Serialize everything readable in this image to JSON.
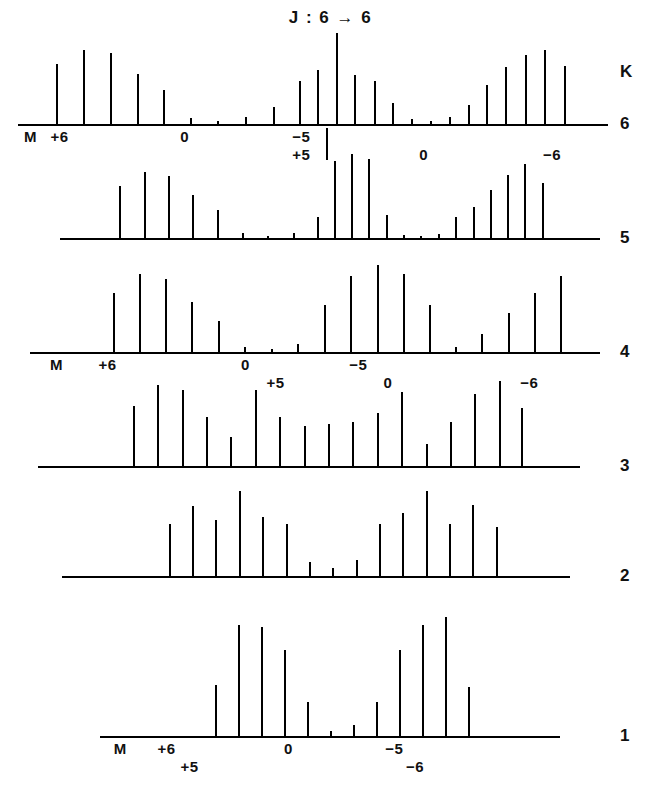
{
  "figure": {
    "title": "J : 6 → 6",
    "k_axis_header": "K",
    "background_color": "#ffffff",
    "ink_color": "#000000"
  },
  "chart_data": {
    "type": "bar",
    "title": "J : 6 → 6",
    "subtitle": "",
    "xlabel": "M",
    "ylabel": "K",
    "grid": false,
    "legend": null,
    "xlim": [
      0,
      100
    ],
    "ylim": [
      0,
      100
    ],
    "x_tick_labels_row_top": [
      "M",
      "+6",
      "0",
      "-5",
      "+5",
      "0",
      "-6"
    ],
    "x_tick_labels_row_middle": [
      "M",
      "+6",
      "0",
      "+5",
      "-5",
      "0",
      "-6"
    ],
    "x_tick_labels_row_bottom": [
      "M",
      "+6",
      "+5",
      "0",
      "-5",
      "-6"
    ],
    "series": [
      {
        "name": "K = 6",
        "k": 6,
        "x": [
          6.4,
          11.1,
          15.6,
          20.1,
          24.6,
          29.2,
          33.8,
          38.5,
          43.2,
          47.6,
          50.7,
          53.9,
          57.0,
          60.3,
          63.4,
          66.6,
          69.8,
          73.0,
          76.2,
          79.4,
          82.6,
          85.9,
          89.2,
          92.5
        ],
        "values": [
          66,
          82,
          78,
          55,
          38,
          8,
          4,
          9,
          20,
          48,
          60,
          100,
          54,
          48,
          24,
          7,
          4,
          9,
          22,
          44,
          63,
          76,
          82,
          64
        ]
      },
      {
        "name": "K = 5",
        "k": 5,
        "x": [
          11.0,
          15.5,
          20.0,
          24.5,
          29.1,
          33.7,
          38.4,
          43.1,
          47.6,
          50.8,
          53.9,
          57.1,
          60.3,
          63.5,
          66.7,
          70.0,
          73.2,
          76.4,
          79.6,
          82.8,
          86.0,
          89.3
        ],
        "values": [
          62,
          79,
          74,
          52,
          34,
          7,
          4,
          7,
          26,
          92,
          100,
          94,
          28,
          5,
          3,
          6,
          26,
          38,
          58,
          75,
          88,
          66
        ]
      },
      {
        "name": "K = 4",
        "k": 4,
        "x": [
          14.5,
          19.1,
          23.7,
          28.3,
          32.9,
          37.5,
          42.2,
          46.8,
          51.5,
          56.1,
          60.8,
          65.4,
          70.0,
          74.6,
          79.2,
          83.8,
          88.4,
          92.9
        ],
        "values": [
          68,
          90,
          84,
          58,
          36,
          7,
          4,
          10,
          55,
          88,
          100,
          90,
          54,
          7,
          22,
          46,
          68,
          88
        ]
      },
      {
        "name": "K = 3",
        "k": 3,
        "x": [
          17.5,
          22.0,
          26.5,
          31.0,
          35.5,
          40.0,
          44.5,
          49.0,
          53.5,
          58.0,
          62.5,
          67.0,
          71.5,
          76.0,
          80.5,
          85.0,
          89.2
        ],
        "values": [
          68,
          92,
          86,
          56,
          34,
          86,
          56,
          46,
          48,
          50,
          60,
          84,
          26,
          50,
          82,
          96,
          66
        ]
      },
      {
        "name": "K = 2",
        "k": 2,
        "x": [
          21.0,
          25.6,
          30.2,
          34.8,
          39.4,
          44.0,
          48.6,
          53.2,
          57.8,
          62.4,
          67.0,
          71.6,
          76.2,
          80.8,
          85.4
        ],
        "values": [
          62,
          82,
          66,
          100,
          70,
          62,
          18,
          10,
          20,
          62,
          74,
          100,
          62,
          84,
          58
        ]
      },
      {
        "name": "K = 1",
        "k": 1,
        "x": [
          25.0,
          30.0,
          35.0,
          40.0,
          45.0,
          50.0,
          55.0,
          60.0,
          65.0,
          70.0,
          75.0,
          80.0
        ],
        "values": [
          42,
          90,
          88,
          70,
          28,
          5,
          10,
          28,
          70,
          90,
          96,
          40
        ]
      }
    ]
  },
  "rows": [
    {
      "k_label": "6",
      "annotations": [
        {
          "name": "m-marker",
          "text": "M",
          "x": 1.0,
          "line": 1
        },
        {
          "name": "tick-plus-6",
          "text": "+6",
          "x": 5.5,
          "line": 1
        },
        {
          "name": "tick-zero-left",
          "text": "0",
          "x": 27.5,
          "line": 1
        },
        {
          "name": "tick-minus-5",
          "text": "−5",
          "x": 46.5,
          "line": 1
        },
        {
          "name": "tick-plus-5",
          "text": "+5",
          "x": 46.5,
          "line": 2
        },
        {
          "name": "tick-zero-right",
          "text": "0",
          "x": 68.0,
          "line": 2
        },
        {
          "name": "tick-minus-6",
          "text": "−6",
          "x": 89.0,
          "line": 2
        }
      ]
    },
    {
      "k_label": "5",
      "annotations": []
    },
    {
      "k_label": "4",
      "annotations": [
        {
          "name": "m-marker",
          "text": "M",
          "x": 3.5,
          "line": 1
        },
        {
          "name": "tick-plus-6",
          "text": "+6",
          "x": 12.0,
          "line": 1
        },
        {
          "name": "tick-zero-left",
          "text": "0",
          "x": 37.0,
          "line": 1
        },
        {
          "name": "tick-plus-5",
          "text": "+5",
          "x": 41.5,
          "line": 2
        },
        {
          "name": "tick-minus-5",
          "text": "−5",
          "x": 56.0,
          "line": 1
        },
        {
          "name": "tick-zero-right",
          "text": "0",
          "x": 62.0,
          "line": 2
        },
        {
          "name": "tick-minus-6",
          "text": "−6",
          "x": 86.0,
          "line": 2
        }
      ]
    },
    {
      "k_label": "3",
      "annotations": []
    },
    {
      "k_label": "2",
      "annotations": []
    },
    {
      "k_label": "1",
      "annotations": [
        {
          "name": "m-marker",
          "text": "M",
          "x": 3.0,
          "line": 1
        },
        {
          "name": "tick-plus-6",
          "text": "+6",
          "x": 12.5,
          "line": 1
        },
        {
          "name": "tick-plus-5",
          "text": "+5",
          "x": 17.5,
          "line": 2
        },
        {
          "name": "tick-zero",
          "text": "0",
          "x": 40.0,
          "line": 1
        },
        {
          "name": "tick-minus-5",
          "text": "−5",
          "x": 62.0,
          "line": 1
        },
        {
          "name": "tick-minus-6",
          "text": "−6",
          "x": 66.5,
          "line": 2
        }
      ]
    }
  ]
}
